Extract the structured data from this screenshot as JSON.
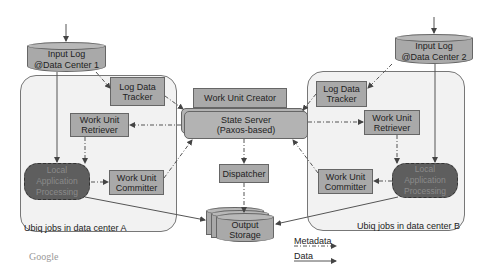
{
  "diagram": {
    "regions": {
      "dc_a": {
        "caption": "Ubiq jobs in data center A"
      },
      "dc_b": {
        "caption": "Ubiq jobs in data center B"
      }
    },
    "nodes": {
      "input_log_1": "Input Log\n@Data Center 1",
      "input_log_2": "Input Log\n@Data Center 2",
      "log_data_tracker_a": "Log Data\nTracker",
      "log_data_tracker_b": "Log Data\nTracker",
      "work_unit_retriever_a": "Work Unit\nRetriever",
      "work_unit_retriever_b": "Work Unit\nRetriever",
      "local_processing_a": "Local\nApplication\nProcessing",
      "local_processing_b": "Local\nApplication\nProcessing",
      "work_unit_committer_a": "Work Unit\nCommitter",
      "work_unit_committer_b": "Work Unit\nCommitter",
      "work_unit_creator": "Work Unit Creator",
      "state_server": "State Server\n(Paxos-based)",
      "dispatcher": "Dispatcher",
      "output_storage": "Output\nStorage"
    },
    "legend": {
      "metadata": "Metadata",
      "data": "Data"
    },
    "footer_logo": "Google",
    "colors": {
      "box_fill": "#a9a9a9",
      "processing_fill": "#5e5e5e",
      "region_fill": "#f2f2f2",
      "line": "#555555"
    }
  }
}
